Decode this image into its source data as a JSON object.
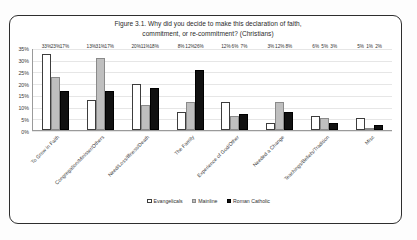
{
  "chart_data": {
    "type": "bar",
    "title": "Figure 3.1. Why did you decide to make this declaration of faith, commitment, or re-commitment? (Christians)",
    "title_line1": "Figure 3.1. Why did you decide to make this declaration of faith,",
    "title_line2": "commitment, or re-commitment? (Christians)",
    "xlabel": "",
    "ylabel": "",
    "ylim": [
      0,
      35
    ],
    "grid": true,
    "legend_position": "bottom",
    "ytick_labels": [
      "0%",
      "5%",
      "10%",
      "15%",
      "20%",
      "25%",
      "30%",
      "35%"
    ],
    "ytick_values": [
      0,
      5,
      10,
      15,
      20,
      25,
      30,
      35
    ],
    "categories": [
      "To Grow in Faith",
      "Congregation/Minister/Others",
      "Need/Loss/Illness/Death",
      "The Family",
      "Experience of God/Other",
      "Needed a Change",
      "Teachings/Beliefs/Tradition",
      "Misc"
    ],
    "series": [
      {
        "name": "Evangelicals",
        "color": "#ffffff",
        "values": [
          33,
          13,
          20,
          8,
          12,
          3,
          6,
          5
        ],
        "labels": [
          "33%",
          "13%",
          "20%",
          "8%",
          "12%",
          "3%",
          "6%",
          "5%"
        ]
      },
      {
        "name": "Mainline",
        "color": "#bfbfbf",
        "values": [
          23,
          31,
          11,
          12,
          6,
          12,
          5,
          1
        ],
        "labels": [
          "23%",
          "31%",
          "11%",
          "12%",
          "6%",
          "12%",
          "5%",
          "1%"
        ]
      },
      {
        "name": "Roman Catholic",
        "color": "#111111",
        "values": [
          17,
          17,
          18,
          26,
          7,
          8,
          3,
          2
        ],
        "labels": [
          "17%",
          "17%",
          "18%",
          "26%",
          "7%",
          "8%",
          "3%",
          "2%"
        ]
      }
    ]
  }
}
